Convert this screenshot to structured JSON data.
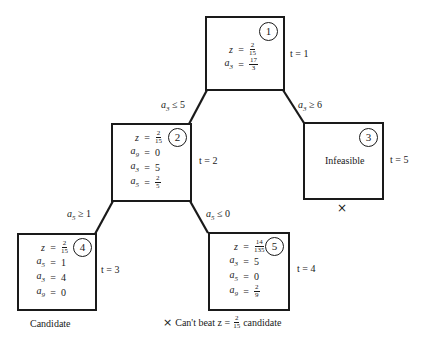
{
  "diagram": {
    "colors": {
      "ink": "#1a1a1a",
      "background": "#ffffff"
    },
    "nodes": [
      {
        "id": "1",
        "badge": "1",
        "t_label": "t = 1",
        "rows": [
          {
            "var": "z",
            "eq": "=",
            "num": "2",
            "den": "15"
          },
          {
            "var": "a3",
            "var_main": "a",
            "var_sub": "3",
            "eq": "=",
            "num": "17",
            "den": "3"
          }
        ]
      },
      {
        "id": "2",
        "badge": "2",
        "t_label": "t = 2",
        "rows": [
          {
            "var": "z",
            "eq": "=",
            "num": "2",
            "den": "15"
          },
          {
            "var_main": "a",
            "var_sub": "9",
            "eq": "=",
            "value": "0"
          },
          {
            "var_main": "a",
            "var_sub": "3",
            "eq": "=",
            "value": "5"
          },
          {
            "var_main": "a",
            "var_sub": "5",
            "eq": "=",
            "num": "2",
            "den": "5"
          }
        ]
      },
      {
        "id": "3",
        "badge": "3",
        "t_label": "t = 5",
        "status": "Infeasible",
        "pruned_mark": "×"
      },
      {
        "id": "4",
        "badge": "4",
        "t_label": "t = 3",
        "caption": "Candidate",
        "rows": [
          {
            "var": "z",
            "eq": "=",
            "num": "2",
            "den": "15"
          },
          {
            "var_main": "a",
            "var_sub": "5",
            "eq": "=",
            "value": "1"
          },
          {
            "var_main": "a",
            "var_sub": "3",
            "eq": "=",
            "value": "4"
          },
          {
            "var_main": "a",
            "var_sub": "9",
            "eq": "=",
            "value": "0"
          }
        ]
      },
      {
        "id": "5",
        "badge": "5",
        "t_label": "t = 4",
        "rows": [
          {
            "var": "z",
            "eq": "=",
            "num": "14",
            "den": "135"
          },
          {
            "var_main": "a",
            "var_sub": "3",
            "eq": "=",
            "value": "5"
          },
          {
            "var_main": "a",
            "var_sub": "5",
            "eq": "=",
            "value": "0"
          },
          {
            "var_main": "a",
            "var_sub": "9",
            "eq": "=",
            "num": "2",
            "den": "9"
          }
        ]
      }
    ],
    "edges": [
      {
        "from": "1",
        "to": "2",
        "var_main": "a",
        "var_sub": "3",
        "op": "≤",
        "value": "5"
      },
      {
        "from": "1",
        "to": "3",
        "var_main": "a",
        "var_sub": "3",
        "op": "≥",
        "value": "6"
      },
      {
        "from": "2",
        "to": "4",
        "var_main": "a",
        "var_sub": "5",
        "op": "≥",
        "value": "1"
      },
      {
        "from": "2",
        "to": "5",
        "var_main": "a",
        "var_sub": "5",
        "op": "≤",
        "value": "0"
      }
    ],
    "pruning_note": {
      "mark": "×",
      "prefix": "Can't  beat z =",
      "num": "2",
      "den": "15",
      "suffix": "candidate"
    }
  }
}
